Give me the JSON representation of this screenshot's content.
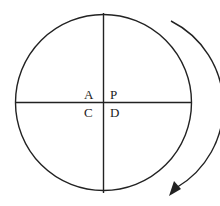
{
  "diagram": {
    "labels": {
      "top_left": "A",
      "top_right": "P",
      "bottom_left": "C",
      "bottom_right": "D"
    },
    "rotation_direction": "clockwise",
    "colors": {
      "stroke": "#222222",
      "background": "#ffffff"
    }
  }
}
